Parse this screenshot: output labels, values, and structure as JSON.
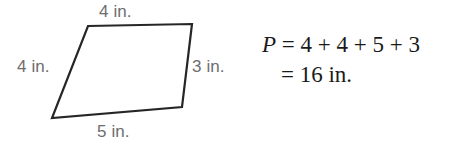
{
  "figure": {
    "shape_name": "quadrilateral",
    "outline_color": "#262626",
    "fill_color": "#ffffff",
    "label_color": "#6d6d6d",
    "vertices": [
      {
        "name": "top-left",
        "x": 88,
        "y": 26
      },
      {
        "name": "top-right",
        "x": 192,
        "y": 24
      },
      {
        "name": "bottom-right",
        "x": 182,
        "y": 107
      },
      {
        "name": "bottom-left",
        "x": 52,
        "y": 118
      }
    ],
    "side_labels": {
      "top": "4 in.",
      "left": "4 in.",
      "right": "3 in.",
      "bottom": "5 in."
    }
  },
  "equation": {
    "text_color": "#1a1a1a",
    "variable": "P",
    "line1_rest": " = 4 + 4 + 5 + 3",
    "line2": "= 16 in.",
    "result_value": "16",
    "result_unit": "in."
  }
}
